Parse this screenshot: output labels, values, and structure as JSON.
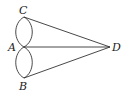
{
  "diagram": {
    "points": {
      "C": {
        "label": "C",
        "x": 24,
        "y": 17
      },
      "A": {
        "label": "A",
        "x": 24,
        "y": 47
      },
      "B": {
        "label": "B",
        "x": 24,
        "y": 78
      },
      "D": {
        "label": "D",
        "x": 110,
        "y": 47
      }
    },
    "segments": [
      [
        "C",
        "D"
      ],
      [
        "A",
        "D"
      ],
      [
        "B",
        "D"
      ]
    ],
    "curves": [
      {
        "name": "upper-lens",
        "from": "C",
        "to": "A"
      },
      {
        "name": "lower-lens",
        "from": "A",
        "to": "B"
      }
    ],
    "colors": {
      "stroke": "#333333",
      "text": "#222222",
      "background": "#ffffff"
    }
  }
}
